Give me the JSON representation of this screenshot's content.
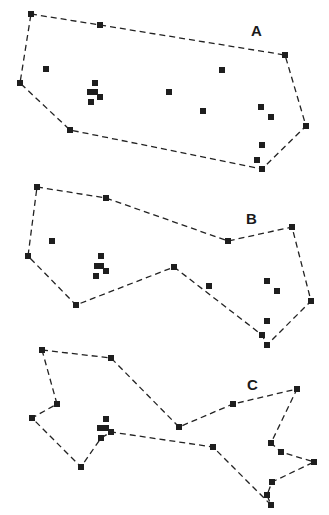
{
  "panels": [
    {
      "label": "A",
      "label_pos": [
        251,
        36
      ],
      "hull": [
        [
          31,
          14
        ],
        [
          100,
          25
        ],
        [
          285,
          55
        ],
        [
          306,
          126
        ],
        [
          262,
          169
        ],
        [
          70,
          130
        ],
        [
          20,
          83
        ]
      ],
      "points": [
        [
          31,
          14
        ],
        [
          100,
          25
        ],
        [
          46,
          69
        ],
        [
          20,
          83
        ],
        [
          95,
          83
        ],
        [
          90,
          92
        ],
        [
          95,
          92
        ],
        [
          100,
          97
        ],
        [
          91,
          102
        ],
        [
          70,
          130
        ],
        [
          285,
          55
        ],
        [
          222,
          70
        ],
        [
          169,
          92
        ],
        [
          203,
          111
        ],
        [
          261,
          107
        ],
        [
          271,
          117
        ],
        [
          306,
          126
        ],
        [
          262,
          145
        ],
        [
          257,
          160
        ],
        [
          262,
          169
        ]
      ]
    },
    {
      "label": "B",
      "label_pos": [
        246,
        224
      ],
      "hull": [
        [
          37,
          187
        ],
        [
          106,
          198
        ],
        [
          228,
          241
        ],
        [
          292,
          227
        ],
        [
          311,
          301
        ],
        [
          267,
          345
        ],
        [
          262,
          335
        ],
        [
          174,
          267
        ],
        [
          76,
          305
        ],
        [
          28,
          256
        ]
      ],
      "points": [
        [
          37,
          187
        ],
        [
          106,
          198
        ],
        [
          52,
          241
        ],
        [
          28,
          256
        ],
        [
          101,
          256
        ],
        [
          97,
          266
        ],
        [
          101,
          266
        ],
        [
          106,
          271
        ],
        [
          96,
          276
        ],
        [
          76,
          305
        ],
        [
          228,
          241
        ],
        [
          292,
          227
        ],
        [
          174,
          267
        ],
        [
          209,
          286
        ],
        [
          267,
          281
        ],
        [
          277,
          291
        ],
        [
          311,
          301
        ],
        [
          267,
          321
        ],
        [
          262,
          335
        ],
        [
          267,
          345
        ]
      ]
    },
    {
      "label": "C",
      "label_pos": [
        247,
        390
      ],
      "hull": [
        [
          42,
          350
        ],
        [
          111,
          358
        ],
        [
          179,
          427
        ],
        [
          233,
          404
        ],
        [
          297,
          389
        ],
        [
          271,
          443
        ],
        [
          281,
          452
        ],
        [
          314,
          462
        ],
        [
          272,
          482
        ],
        [
          267,
          495
        ],
        [
          271,
          505
        ],
        [
          213,
          447
        ],
        [
          111,
          432
        ],
        [
          101,
          438
        ],
        [
          81,
          467
        ],
        [
          32,
          418
        ],
        [
          57,
          404
        ]
      ],
      "points": [
        [
          42,
          350
        ],
        [
          111,
          358
        ],
        [
          57,
          404
        ],
        [
          32,
          418
        ],
        [
          106,
          419
        ],
        [
          100,
          428
        ],
        [
          106,
          428
        ],
        [
          111,
          432
        ],
        [
          101,
          438
        ],
        [
          81,
          467
        ],
        [
          179,
          427
        ],
        [
          233,
          404
        ],
        [
          297,
          389
        ],
        [
          271,
          443
        ],
        [
          281,
          452
        ],
        [
          314,
          462
        ],
        [
          272,
          482
        ],
        [
          267,
          495
        ],
        [
          271,
          505
        ],
        [
          213,
          447
        ]
      ]
    }
  ]
}
